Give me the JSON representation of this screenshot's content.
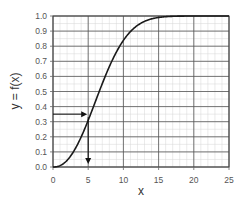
{
  "chart_data": {
    "type": "line",
    "title": "",
    "xlabel": "x",
    "ylabel": "y = f(x)",
    "xlim": [
      0,
      25
    ],
    "ylim": [
      0,
      1.0
    ],
    "x_ticks": [
      "0",
      "5",
      "10",
      "15",
      "20",
      "25"
    ],
    "y_ticks": [
      "0.0",
      "0.1",
      "0.2",
      "0.3",
      "0.4",
      "0.5",
      "0.6",
      "0.7",
      "0.8",
      "0.9",
      "1.0"
    ],
    "grid": true,
    "minor_grid": true,
    "legend": null,
    "series": [
      {
        "name": "f(x)",
        "x": [
          0,
          1,
          2,
          3,
          4,
          5,
          6,
          7,
          8,
          9,
          10,
          11,
          12,
          13,
          14,
          15,
          16,
          17,
          18,
          19,
          20,
          21,
          22,
          23,
          24,
          25
        ],
        "values": [
          0.0,
          0.009,
          0.044,
          0.11,
          0.2,
          0.31,
          0.43,
          0.55,
          0.66,
          0.76,
          0.84,
          0.89,
          0.93,
          0.96,
          0.975,
          0.985,
          0.991,
          0.995,
          0.997,
          0.998,
          0.999,
          1.0,
          1.0,
          1.0,
          1.0,
          1.0
        ]
      }
    ],
    "annotations": [
      {
        "type": "arrow",
        "from": [
          0,
          0.35
        ],
        "to": [
          5,
          0.35
        ],
        "description": "horizontal arrow from y-axis at 0.35 to curve"
      },
      {
        "type": "arrow",
        "from": [
          5,
          0.33
        ],
        "to": [
          5,
          0.0
        ],
        "description": "vertical arrow from curve down to x-axis at x=5"
      }
    ]
  }
}
